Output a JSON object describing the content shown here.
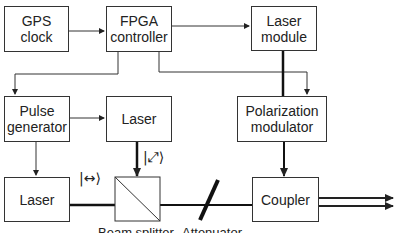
{
  "diagram": {
    "blocks": {
      "gps_clock": "GPS clock",
      "fpga_controller": "FPGA controller",
      "laser_module": "Laser module",
      "pulse_generator": "Pulse generator",
      "laser_signal": "Laser",
      "polarization_modulator": "Polarization modulator",
      "laser_reference": "Laser",
      "coupler": "Coupler"
    },
    "states": {
      "horizontal": "|↔⟩",
      "diagonal": "|⤢⟩"
    },
    "labels": {
      "beam_splitter": "Beam splitter",
      "attenuator": "Attenuator"
    }
  }
}
